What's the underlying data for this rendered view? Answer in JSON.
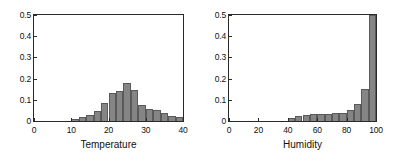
{
  "figure": {
    "background": "#ffffff",
    "bar_fill": "#858585",
    "bar_edge": "#5a5a5a",
    "axis_color": "#2a2a2a"
  },
  "chart_data": [
    {
      "type": "bar",
      "title": "",
      "xlabel": "Temperature",
      "ylabel": "",
      "xlim": [
        0,
        40
      ],
      "ylim": [
        0,
        0.5
      ],
      "grid": false,
      "legend": false,
      "xticks": [
        0,
        10,
        20,
        30,
        40
      ],
      "xtick_labels": [
        "0",
        "10",
        "20",
        "30",
        "40"
      ],
      "yticks": [
        0,
        0.1,
        0.2,
        0.3,
        0.4,
        0.5
      ],
      "ytick_labels": [
        "0",
        "0.1",
        "0.2",
        "0.3",
        "0.4",
        "0.5"
      ],
      "bin_width": 2,
      "bin_edges": [
        10,
        12,
        14,
        16,
        18,
        20,
        22,
        24,
        26,
        28,
        30,
        32,
        34,
        36,
        38,
        40
      ],
      "categories": [
        "10-12",
        "12-14",
        "14-16",
        "16-18",
        "18-20",
        "20-22",
        "22-24",
        "24-26",
        "26-28",
        "28-30",
        "30-32",
        "32-34",
        "34-36",
        "36-38",
        "38-40"
      ],
      "values": [
        0.008,
        0.018,
        0.028,
        0.045,
        0.085,
        0.13,
        0.142,
        0.18,
        0.145,
        0.077,
        0.059,
        0.053,
        0.04,
        0.023,
        0.02
      ]
    },
    {
      "type": "bar",
      "title": "",
      "xlabel": "Humidity",
      "ylabel": "",
      "xlim": [
        0,
        100
      ],
      "ylim": [
        0,
        0.5
      ],
      "grid": false,
      "legend": false,
      "xticks": [
        0,
        20,
        40,
        60,
        80,
        100
      ],
      "xtick_labels": [
        "0",
        "20",
        "40",
        "60",
        "80",
        "100"
      ],
      "yticks": [
        0,
        0.1,
        0.2,
        0.3,
        0.4,
        0.5
      ],
      "ytick_labels": [
        "0",
        "0.1",
        "0.2",
        "0.3",
        "0.4",
        "0.5"
      ],
      "bin_width": 5,
      "bin_edges": [
        40,
        45,
        50,
        55,
        60,
        65,
        70,
        75,
        80,
        85,
        90,
        95,
        100
      ],
      "categories": [
        "40-45",
        "45-50",
        "50-55",
        "55-60",
        "60-65",
        "65-70",
        "70-75",
        "75-80",
        "80-85",
        "85-90",
        "90-95",
        "95-100"
      ],
      "values": [
        0.012,
        0.022,
        0.03,
        0.031,
        0.032,
        0.034,
        0.038,
        0.04,
        0.05,
        0.078,
        0.15,
        0.5
      ]
    }
  ]
}
